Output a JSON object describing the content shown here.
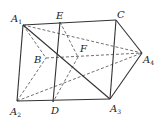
{
  "figure": {
    "type": "geometry-3d-fold",
    "points": {
      "A1": {
        "label": "A",
        "sub": "1",
        "x": 23,
        "y": 25,
        "lx": 11,
        "ly": 22
      },
      "E": {
        "label": "E",
        "sub": "",
        "x": 60,
        "y": 22,
        "lx": 56,
        "ly": 19
      },
      "C": {
        "label": "C",
        "sub": "",
        "x": 116,
        "y": 20,
        "lx": 117,
        "ly": 18
      },
      "A4": {
        "label": "A",
        "sub": "4",
        "x": 142,
        "y": 53,
        "lx": 143,
        "ly": 63
      },
      "F": {
        "label": "F",
        "sub": "",
        "x": 78,
        "y": 57,
        "lx": 80,
        "ly": 52
      },
      "B": {
        "label": "B",
        "sub": "",
        "x": 46,
        "y": 58,
        "lx": 34,
        "ly": 63
      },
      "A2": {
        "label": "A",
        "sub": "2",
        "x": 17,
        "y": 101,
        "lx": 10,
        "ly": 115
      },
      "D": {
        "label": "D",
        "sub": "",
        "x": 53,
        "y": 102,
        "lx": 51,
        "ly": 114
      },
      "A3": {
        "label": "A",
        "sub": "3",
        "x": 110,
        "y": 99,
        "lx": 110,
        "ly": 112
      }
    },
    "solid_edges": [
      [
        "A1",
        "C"
      ],
      [
        "A1",
        "A2"
      ],
      [
        "A2",
        "A3"
      ],
      [
        "A3",
        "A4"
      ],
      [
        "C",
        "A4"
      ],
      [
        "C",
        "A3"
      ],
      [
        "E",
        "D"
      ],
      [
        "A1",
        "A3"
      ]
    ],
    "dashed_edges": [
      [
        "A1",
        "A4"
      ],
      [
        "A2",
        "A4"
      ],
      [
        "B",
        "A4"
      ],
      [
        "A1",
        "B"
      ],
      [
        "A2",
        "B"
      ],
      [
        "E",
        "F"
      ],
      [
        "F",
        "D"
      ]
    ],
    "line_color": "#333333"
  }
}
